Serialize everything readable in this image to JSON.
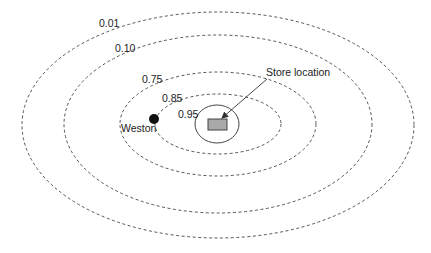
{
  "diagram": {
    "contours": [
      {
        "label": "0.01",
        "cx": 218,
        "cy": 125,
        "rx": 196,
        "ry": 113,
        "label_x": 99,
        "label_y": 27
      },
      {
        "label": "0.10",
        "cx": 218,
        "cy": 124,
        "rx": 154,
        "ry": 89,
        "label_x": 115,
        "label_y": 52
      },
      {
        "label": "0.75",
        "cx": 218,
        "cy": 124,
        "rx": 98,
        "ry": 52,
        "label_x": 142,
        "label_y": 83
      },
      {
        "label": "0.85",
        "cx": 218,
        "cy": 124,
        "rx": 63,
        "ry": 30,
        "label_x": 162,
        "label_y": 102
      },
      {
        "label": "0.95",
        "cx": 217,
        "cy": 124,
        "rx": 22,
        "ry": 19,
        "label_x": 178,
        "label_y": 118
      }
    ],
    "store": {
      "label": "Store location",
      "label_x": 266,
      "label_y": 76,
      "rect": {
        "x": 208,
        "y": 119,
        "width": 19,
        "height": 11
      },
      "fill_color": "#a9a9a9"
    },
    "town": {
      "label": "Weston",
      "dot_cx": 154,
      "dot_cy": 119,
      "dot_r": 5,
      "label_x": 121,
      "label_y": 132
    },
    "colors": {
      "line": "#555555",
      "text": "#222222",
      "background": "#ffffff"
    }
  }
}
